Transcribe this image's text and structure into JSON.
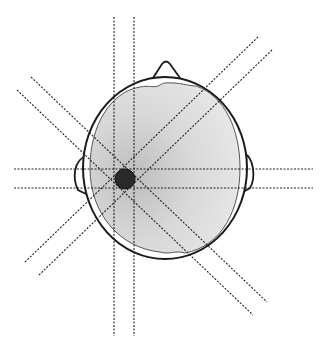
{
  "figure": {
    "colors": {
      "background": "#ffffff",
      "outline": "#1a1a1a",
      "brain_fill": "#d6d6d6",
      "lesion": "#2a2a2a",
      "beam_line": "#222222"
    },
    "elements": {
      "head_outline": "head-outline",
      "brain": "brain-region",
      "nose": "nose",
      "left_ear": "left-ear",
      "right_ear": "right-ear",
      "lesion": "target-lesion",
      "beams": [
        "vertical-beam-pair",
        "horizontal-beam-pair",
        "diagonal-beam-pair-nw-se",
        "diagonal-beam-pair-ne-sw"
      ]
    }
  }
}
